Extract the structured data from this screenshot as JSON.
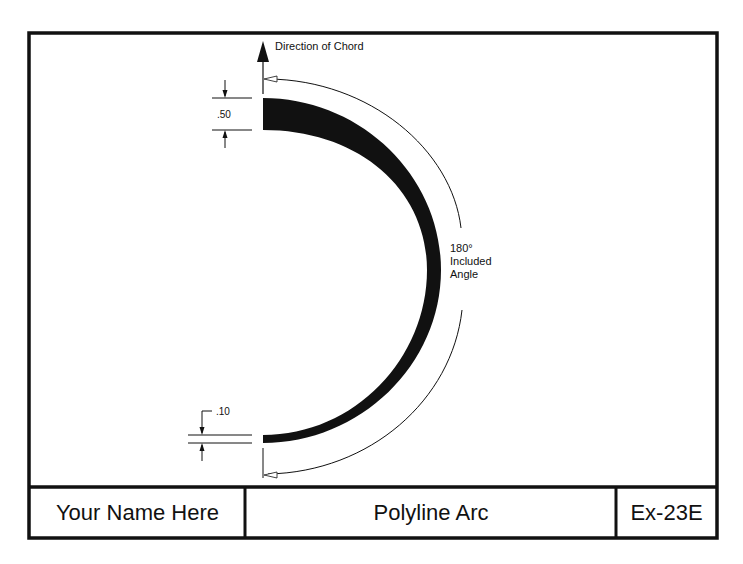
{
  "drawing": {
    "direction_label": "Direction of Chord",
    "angle_label": {
      "line1": "180°",
      "line2": "Included",
      "line3": "Angle"
    },
    "start_width_label": ".50",
    "end_width_label": ".10"
  },
  "title_block": {
    "name": "Your Name Here",
    "title": "Polyline Arc",
    "exercise": "Ex-23E"
  },
  "colors": {
    "ink": "#111111",
    "paper": "#ffffff"
  }
}
